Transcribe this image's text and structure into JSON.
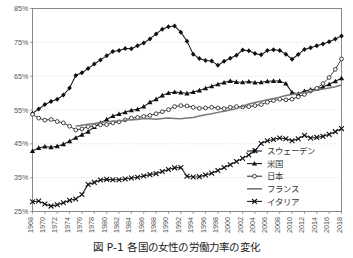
{
  "caption": "図 P-1  各国の女性の労働力率の変化",
  "chart_data": {
    "type": "line",
    "title": "",
    "xlabel": "",
    "ylabel": "",
    "ylim": [
      25,
      85
    ],
    "ytick_values": [
      25,
      35,
      45,
      55,
      65,
      75,
      85
    ],
    "ytick_labels": [
      "25%",
      "35%",
      "45%",
      "55%",
      "65%",
      "75%",
      "85%"
    ],
    "grid": true,
    "legend_position": "bottom-right",
    "x": [
      1968,
      1969,
      1970,
      1971,
      1972,
      1973,
      1974,
      1975,
      1976,
      1977,
      1978,
      1979,
      1980,
      1981,
      1982,
      1983,
      1984,
      1985,
      1986,
      1987,
      1988,
      1989,
      1990,
      1991,
      1992,
      1993,
      1994,
      1995,
      1996,
      1997,
      1998,
      1999,
      2000,
      2001,
      2002,
      2003,
      2004,
      2005,
      2006,
      2007,
      2008,
      2009,
      2010,
      2011,
      2012,
      2013,
      2014,
      2015,
      2016,
      2017,
      2018
    ],
    "xtick_labels": [
      "1968",
      "1970",
      "1972",
      "1974",
      "1976",
      "1978",
      "1980",
      "1982",
      "1984",
      "1986",
      "1988",
      "1990",
      "1992",
      "1994",
      "1996",
      "1998",
      "2000",
      "2002",
      "2004",
      "2006",
      "2008",
      "2010",
      "2012",
      "2014",
      "2016",
      "2018"
    ],
    "xtick_values": [
      1968,
      1970,
      1972,
      1974,
      1976,
      1978,
      1980,
      1982,
      1984,
      1986,
      1988,
      1990,
      1992,
      1994,
      1996,
      1998,
      2000,
      2002,
      2004,
      2006,
      2008,
      2010,
      2012,
      2014,
      2016,
      2018
    ],
    "series": [
      {
        "name": "スウェーデン",
        "marker": "diamond",
        "color": "#111111",
        "values": [
          54.0,
          55.3,
          56.6,
          57.5,
          58.2,
          59.4,
          61.5,
          65.2,
          66.0,
          67.3,
          68.6,
          69.8,
          71.0,
          72.3,
          72.6,
          73.2,
          73.1,
          74.0,
          74.8,
          76.0,
          77.5,
          78.9,
          79.6,
          79.8,
          78.0,
          75.3,
          71.5,
          70.2,
          69.6,
          69.5,
          68.2,
          69.4,
          70.3,
          71.2,
          72.7,
          72.5,
          71.7,
          71.3,
          72.6,
          72.8,
          72.6,
          71.5,
          70.0,
          71.4,
          72.9,
          73.4,
          74.0,
          74.5,
          75.2,
          76.0,
          76.9
        ]
      },
      {
        "name": "米国",
        "marker": "triangle",
        "color": "#111111",
        "values": [
          42.9,
          43.8,
          44.2,
          44.0,
          44.3,
          44.9,
          45.8,
          46.8,
          47.7,
          48.6,
          50.0,
          51.2,
          52.2,
          53.2,
          53.8,
          54.3,
          54.9,
          55.2,
          56.0,
          57.3,
          58.2,
          59.3,
          60.0,
          60.3,
          60.2,
          59.9,
          60.3,
          60.8,
          61.4,
          62.0,
          62.6,
          63.1,
          63.6,
          63.3,
          63.2,
          63.4,
          63.1,
          63.2,
          63.5,
          63.6,
          63.6,
          62.8,
          60.2,
          59.8,
          60.6,
          61.0,
          61.3,
          61.8,
          62.6,
          63.5,
          64.4
        ]
      },
      {
        "name": "日本",
        "marker": "circle-open",
        "color": "#2b2b2b",
        "values": [
          53.7,
          52.6,
          52.0,
          52.2,
          51.6,
          51.2,
          50.2,
          49.1,
          49.4,
          50.1,
          50.3,
          50.6,
          50.7,
          51.2,
          51.5,
          52.1,
          52.6,
          52.8,
          53.1,
          53.4,
          53.9,
          54.5,
          55.1,
          56.0,
          56.3,
          56.2,
          55.8,
          55.5,
          55.6,
          55.8,
          55.6,
          55.4,
          55.8,
          56.0,
          55.9,
          56.0,
          56.3,
          56.6,
          57.3,
          57.8,
          58.2,
          58.0,
          58.2,
          58.9,
          59.6,
          60.6,
          61.4,
          62.8,
          64.6,
          67.0,
          70.1
        ]
      },
      {
        "name": "フランス",
        "marker": "none",
        "color": "#777777",
        "values": [
          null,
          null,
          null,
          null,
          null,
          null,
          null,
          50.2,
          50.5,
          50.8,
          51.0,
          51.3,
          51.5,
          51.7,
          51.8,
          52.0,
          52.1,
          52.2,
          52.5,
          52.4,
          52.3,
          52.5,
          52.6,
          52.5,
          52.4,
          52.6,
          52.8,
          53.2,
          53.6,
          53.9,
          54.3,
          54.6,
          55.0,
          55.4,
          56.1,
          56.8,
          57.2,
          57.6,
          58.0,
          58.4,
          58.8,
          59.3,
          59.6,
          59.9,
          60.2,
          60.5,
          60.9,
          61.2,
          61.5,
          61.9,
          62.4
        ]
      },
      {
        "name": "イタリア",
        "marker": "x",
        "color": "#111111",
        "values": [
          27.9,
          28.1,
          27.2,
          26.6,
          27.0,
          27.6,
          28.3,
          28.7,
          30.0,
          33.0,
          33.6,
          34.3,
          34.5,
          34.4,
          34.4,
          34.6,
          34.9,
          35.1,
          35.5,
          35.9,
          36.2,
          36.8,
          37.4,
          37.9,
          38.0,
          35.4,
          35.2,
          35.3,
          35.8,
          36.3,
          37.1,
          38.0,
          38.8,
          39.8,
          40.7,
          41.7,
          43.0,
          45.1,
          45.9,
          46.3,
          46.7,
          46.5,
          45.9,
          46.5,
          47.5,
          46.7,
          46.9,
          47.2,
          47.8,
          48.6,
          49.5
        ]
      }
    ]
  }
}
